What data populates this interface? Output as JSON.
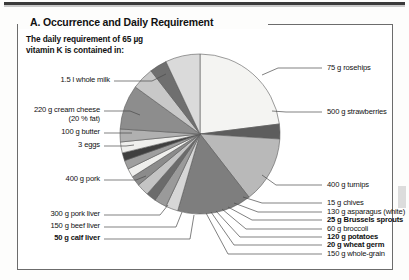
{
  "figure": {
    "title": "A. Occurrence and Daily Requirement",
    "intro": "The daily requirement of 65 µg\nvitamin K is contained in:"
  },
  "chart_data": {
    "type": "pie",
    "title": "A. Occurrence and Daily Requirement",
    "subtitle": "The daily requirement of 65 µg vitamin K is contained in:",
    "unit_note": "Each slice is one food portion supplying 65 µg vitamin K",
    "legend": "leader-line labels around pie",
    "grid": false,
    "labels": [
      "1.5 l whole milk",
      "75 g rosehips",
      "500 g strawberries",
      "400 g turnips",
      "15 g chives",
      "130 g asparagus (white)",
      "25 g Brussels sprouts",
      "60 g broccoli",
      "120 g potatoes",
      "20 g wheat germ",
      "150 g whole-grain",
      "50 g calf liver",
      "150 g beef liver",
      "300 g pork liver",
      "400 g pork",
      "3 eggs",
      "100 g butter",
      "220 g cream cheese (20 % fat)"
    ],
    "slices": [
      {
        "label": "1.5 l whole milk",
        "value": 23.0,
        "color": "#f4f4f2",
        "bold": false
      },
      {
        "label": "75 g rosehips",
        "value": 3.0,
        "color": "#5d5d5d",
        "bold": false
      },
      {
        "label": "500 g strawberries",
        "value": 13.5,
        "color": "#b9b9b9",
        "bold": false
      },
      {
        "label": "400 g turnips",
        "value": 15.0,
        "color": "#7e7e7e",
        "bold": false
      },
      {
        "label": "15 g chives",
        "value": 2.5,
        "color": "#d6d6d6",
        "bold": false
      },
      {
        "label": "130 g asparagus (white)",
        "value": 2.5,
        "color": "#9a9a9a",
        "bold": false
      },
      {
        "label": "25 g Brussels sprouts",
        "value": 2.0,
        "color": "#6b6b6b",
        "bold": true
      },
      {
        "label": "60 g broccoli",
        "value": 2.5,
        "color": "#c4c4c4",
        "bold": false
      },
      {
        "label": "120 g potatoes",
        "value": 2.0,
        "color": "#8b8b8b",
        "bold": true
      },
      {
        "label": "20 g wheat germ",
        "value": 1.8,
        "color": "#efefed",
        "bold": true
      },
      {
        "label": "150 g whole-grain",
        "value": 1.8,
        "color": "#9f9f9f",
        "bold": false
      },
      {
        "label": "50 g calf liver",
        "value": 1.6,
        "color": "#3f3f3f",
        "bold": true
      },
      {
        "label": "150 g beef liver",
        "value": 2.2,
        "color": "#efefed",
        "bold": false
      },
      {
        "label": "300 g pork liver",
        "value": 2.6,
        "color": "#b0b0b0",
        "bold": false
      },
      {
        "label": "400 g pork",
        "value": 9.0,
        "color": "#8d8d8d",
        "bold": false
      },
      {
        "label": "3 eggs",
        "value": 4.5,
        "color": "#c8c8c8",
        "bold": false
      },
      {
        "label": "100 g butter",
        "value": 3.5,
        "color": "#6f6f6f",
        "bold": false
      },
      {
        "label": "220 g cream cheese (20 % fat)",
        "value": 7.0,
        "color": "#dadada",
        "bold": false
      }
    ]
  },
  "labels_left": [
    {
      "text": "1.5 l whole milk",
      "bold": false
    },
    {
      "text": "220 g cream cheese",
      "bold": false
    },
    {
      "text": "(20 % fat)",
      "bold": false
    },
    {
      "text": "100 g butter",
      "bold": false
    },
    {
      "text": "3 eggs",
      "bold": false
    },
    {
      "text": "400 g pork",
      "bold": false
    },
    {
      "text": "300 g pork liver",
      "bold": false
    },
    {
      "text": "150 g beef liver",
      "bold": false
    },
    {
      "text": "50 g calf liver",
      "bold": true
    }
  ],
  "labels_right": [
    {
      "text": "75 g rosehips",
      "bold": false
    },
    {
      "text": "500 g strawberries",
      "bold": false
    },
    {
      "text": "400 g turnips",
      "bold": false
    },
    {
      "text": "15 g chives",
      "bold": false
    },
    {
      "text": "130 g asparagus (white)",
      "bold": false
    },
    {
      "text": "25 g Brussels sprouts",
      "bold": true
    },
    {
      "text": "60 g broccoli",
      "bold": false
    },
    {
      "text": "120 g potatoes",
      "bold": true
    },
    {
      "text": "20 g wheat germ",
      "bold": true
    },
    {
      "text": "150 g whole-grain",
      "bold": false
    }
  ],
  "colors": {
    "frame": "#6c6c6c",
    "text": "#111111",
    "page": "#fdfdfc",
    "leader": "#4a4a4a"
  }
}
